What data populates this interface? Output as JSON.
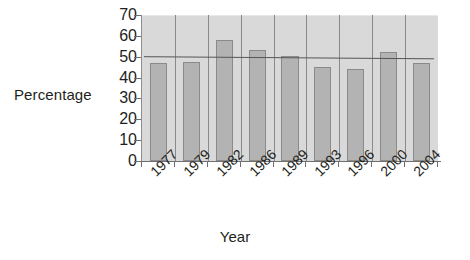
{
  "chart_data": {
    "type": "bar",
    "title": "",
    "xlabel": "Year",
    "ylabel": "Percentage",
    "categories": [
      "1977",
      "1979",
      "1982",
      "1986",
      "1989",
      "1993",
      "1996",
      "2000",
      "2004"
    ],
    "values": [
      47,
      47.5,
      58,
      53,
      50.5,
      45,
      44,
      52.5,
      47
    ],
    "ylim": [
      0,
      70
    ],
    "ytick_labels": [
      "70",
      "60",
      "50",
      "40",
      "30",
      "20",
      "10",
      "0"
    ],
    "ytick_values": [
      70,
      60,
      50,
      40,
      30,
      20,
      10,
      0
    ],
    "ystep": 10,
    "grid": "vertical",
    "legend": "none",
    "series": [
      {
        "name": "Percentage",
        "values": [
          47,
          47.5,
          58,
          53,
          50.5,
          45,
          44,
          52.5,
          47
        ],
        "color": "#b3b3b3"
      },
      {
        "name": "trendline",
        "type": "line",
        "start_value": 50,
        "end_value": 49,
        "color": "#555555"
      }
    ],
    "colors": {
      "bar_fill": "#b3b3b3",
      "bar_edge": "#8a8a8a",
      "plot_background": "#d9d9d9",
      "gridline": "#8a8a8a",
      "axis": "#6f6f6f",
      "text": "#231f20",
      "trendline": "#555555",
      "page_background": "#ffffff"
    }
  }
}
